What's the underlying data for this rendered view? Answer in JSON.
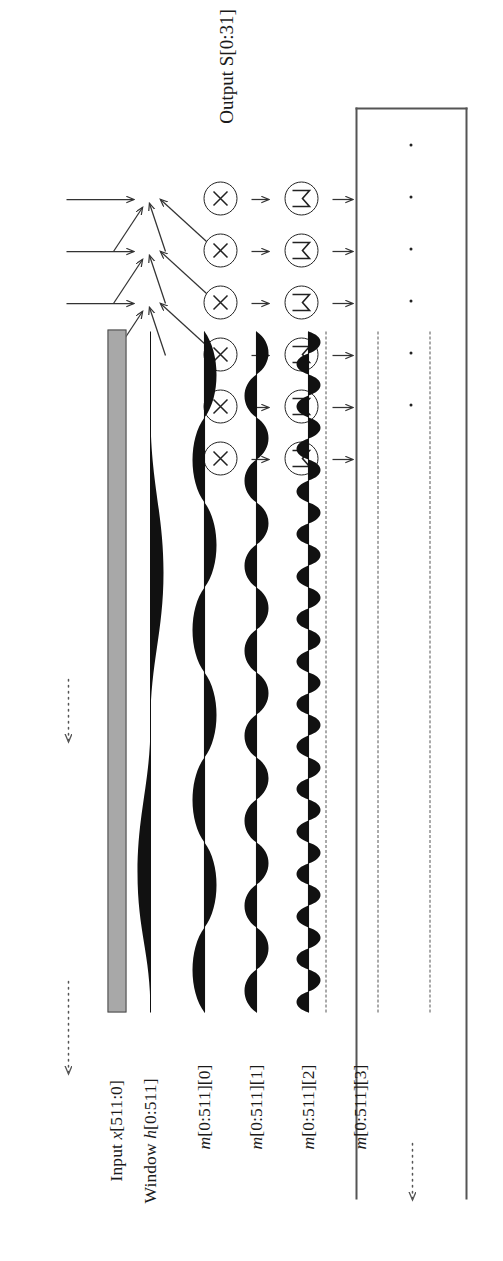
{
  "figure": {
    "type": "signal-flow-diagram",
    "orientation": "rotated-90-ccw",
    "output_label": "Output S[0:31]",
    "rows": [
      {
        "id": "input",
        "label_plain": "Input x[511:0]",
        "label_prefix": "Input ",
        "label_math": "x",
        "label_suffix": "[511:0]",
        "render": "gray-bar"
      },
      {
        "id": "window",
        "label_plain": "Window h[0:511]",
        "label_prefix": "Window ",
        "label_math": "h",
        "label_suffix": "[0:511]",
        "render": "hann-window"
      },
      {
        "id": "m0",
        "label_plain": "m[0:511][0]",
        "label_prefix": "",
        "label_math": "m",
        "label_suffix": "[0:511][0]",
        "render": "sine",
        "cycles": 4
      },
      {
        "id": "m1",
        "label_plain": "m[0:511][1]",
        "label_prefix": "",
        "label_math": "m",
        "label_suffix": "[0:511][1]",
        "render": "sine",
        "cycles": 8
      },
      {
        "id": "m2",
        "label_plain": "m[0:511][2]",
        "label_prefix": "",
        "label_math": "m",
        "label_suffix": "[0:511][2]",
        "render": "sine",
        "cycles": 16
      },
      {
        "id": "m3",
        "label_plain": "m[0:511][3]",
        "label_prefix": "",
        "label_math": "m",
        "label_suffix": "[0:511][3]",
        "render": "dashed"
      },
      {
        "id": "m4",
        "label_plain": "",
        "label_prefix": "",
        "label_math": "",
        "label_suffix": "",
        "render": "dashed"
      },
      {
        "id": "m5",
        "label_plain": "",
        "label_prefix": "",
        "label_math": "",
        "label_suffix": "",
        "render": "dashed"
      }
    ],
    "operators": {
      "multiply_count": 6,
      "multiply_glyph": "multiply-circle-icon",
      "accumulate_count": 6,
      "accumulate_glyph": "magnitude-circle-icon"
    },
    "output_dots": 6,
    "continuation_marker": "dotted-arrow",
    "continuation_count": 3,
    "colors": {
      "ink": "#1a1a1a",
      "line": "#555555",
      "input_fill": "#a8a8a8",
      "input_stroke": "#4a4a4a",
      "wave_fill": "#111111"
    }
  }
}
